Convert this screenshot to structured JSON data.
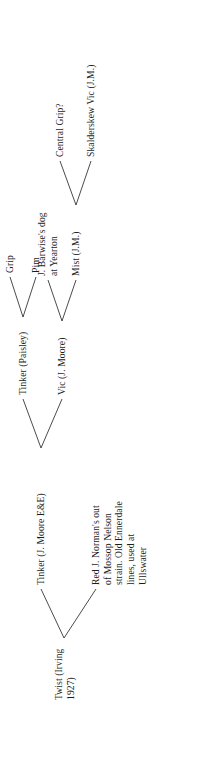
{
  "figure": {
    "type": "pedigree-tree",
    "orientation": "rotated-90-ccw",
    "line_color": "#2a2a2a",
    "text_color": "#1c1c1c",
    "background": "#ffffff"
  },
  "nodes": {
    "root": {
      "label": "Twist (Irving\n1927)"
    },
    "gen1_a": {
      "label": "Tinker (J. Moore E&E)"
    },
    "gen1_b": {
      "label": "Red J. Norman's out\nof Mossop Nelson\nstrain. Old Ennerdale\nlines, used at\nUllswater"
    },
    "gen2_a": {
      "label": "Tinker (Paisley)"
    },
    "gen2_b": {
      "label": "Vic (J. Moore)"
    },
    "gen3_a": {
      "label": "Grip"
    },
    "gen3_b": {
      "label": "Pim"
    },
    "gen3_c": {
      "label": "J. Barwise's dog\nat Yearton"
    },
    "gen3_d": {
      "label": "Mist (J.M.)"
    },
    "gen4_a": {
      "label": "Central Grip?"
    },
    "gen4_b": {
      "label": "Skalderskew Vic (J.M.)"
    }
  },
  "edges": [
    {
      "from": "root",
      "to": "gen1_a"
    },
    {
      "from": "root",
      "to": "gen1_b"
    },
    {
      "from": "gen1_a",
      "to": "gen2_a"
    },
    {
      "from": "gen1_a",
      "to": "gen2_b"
    },
    {
      "from": "gen2_a",
      "to": "gen3_a"
    },
    {
      "from": "gen2_a",
      "to": "gen3_b"
    },
    {
      "from": "gen2_b",
      "to": "gen3_c"
    },
    {
      "from": "gen2_b",
      "to": "gen3_d"
    },
    {
      "from": "gen3_d",
      "to": "gen4_a"
    },
    {
      "from": "gen3_d",
      "to": "gen4_b"
    }
  ]
}
